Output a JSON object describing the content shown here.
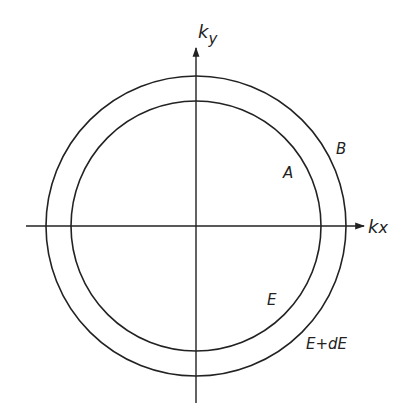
{
  "diagram": {
    "type": "k-space shells",
    "axes": {
      "x_label_main": "k",
      "x_label_sub": "x",
      "y_label_main": "k",
      "y_label_sub": "y"
    },
    "circles": [
      {
        "id": "inner",
        "label": "A",
        "energy_label": "E"
      },
      {
        "id": "outer",
        "label": "B",
        "energy_label": "E+dE"
      }
    ],
    "labels": {
      "A": "A",
      "B": "B",
      "E": "E",
      "E_plus_dE": "E+dE"
    },
    "colors": {
      "line": "#222222",
      "background": "#ffffff"
    }
  }
}
